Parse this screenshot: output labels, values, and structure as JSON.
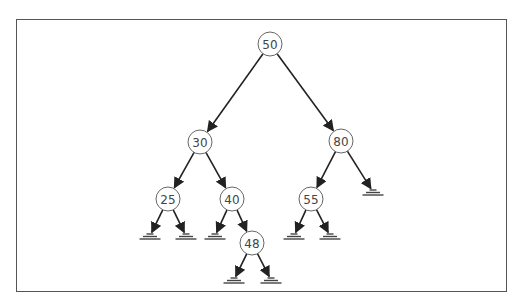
{
  "diagram": {
    "type": "binary-search-tree",
    "colors": {
      "frame": "#555555",
      "node_stroke": "#666666",
      "edge": "#222222",
      "text": "#444444"
    },
    "nodes": [
      {
        "id": "n50",
        "label": "50",
        "x": 270,
        "y": 44
      },
      {
        "id": "n30",
        "label": "30",
        "x": 200,
        "y": 142
      },
      {
        "id": "n80",
        "label": "80",
        "x": 341,
        "y": 141
      },
      {
        "id": "n25",
        "label": "25",
        "x": 168,
        "y": 199
      },
      {
        "id": "n40",
        "label": "40",
        "x": 232,
        "y": 199
      },
      {
        "id": "n55",
        "label": "55",
        "x": 311,
        "y": 199
      },
      {
        "id": "n48",
        "label": "48",
        "x": 252,
        "y": 243
      }
    ],
    "edges": [
      {
        "from": "n50",
        "to": "n30"
      },
      {
        "from": "n50",
        "to": "n80"
      },
      {
        "from": "n30",
        "to": "n25"
      },
      {
        "from": "n30",
        "to": "n40"
      },
      {
        "from": "n80",
        "to": "n55"
      },
      {
        "from": "n80",
        "to": "null_80R"
      },
      {
        "from": "n25",
        "to": "null_25L"
      },
      {
        "from": "n25",
        "to": "null_25R"
      },
      {
        "from": "n40",
        "to": "null_40L"
      },
      {
        "from": "n40",
        "to": "n48"
      },
      {
        "from": "n55",
        "to": "null_55L"
      },
      {
        "from": "n55",
        "to": "null_55R"
      },
      {
        "from": "n48",
        "to": "null_48L"
      },
      {
        "from": "n48",
        "to": "null_48R"
      }
    ],
    "null_leaves": [
      {
        "id": "null_25L",
        "x": 150,
        "y": 236
      },
      {
        "id": "null_25R",
        "x": 186,
        "y": 236
      },
      {
        "id": "null_40L",
        "x": 215,
        "y": 236
      },
      {
        "id": "null_55L",
        "x": 294,
        "y": 236
      },
      {
        "id": "null_55R",
        "x": 330,
        "y": 236
      },
      {
        "id": "null_80R",
        "x": 373,
        "y": 192
      },
      {
        "id": "null_48L",
        "x": 234,
        "y": 280
      },
      {
        "id": "null_48R",
        "x": 271,
        "y": 280
      }
    ]
  }
}
